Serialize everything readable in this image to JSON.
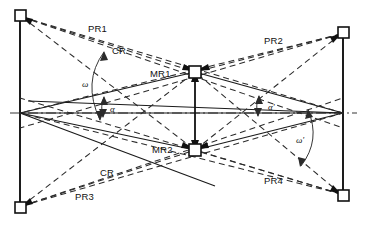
{
  "figure": {
    "background_color": "#ffffff",
    "line_color": "#111111",
    "dash_color": "#2b2b2b"
  },
  "labels": {
    "pr1": "PR1",
    "pr2": "PR2",
    "pr3": "PR3",
    "pr4": "PR4",
    "cr_top": "CR",
    "cr_bottom": "CR",
    "mr1": "MR1",
    "mr2": "MR2",
    "omega": "ω",
    "alpha": "α",
    "alpha_prime": "α'",
    "omega_prime": "ω'"
  },
  "nodes": [
    {
      "name": "corner-top-left",
      "x": 20,
      "y": 15,
      "shape": "square"
    },
    {
      "name": "corner-bottom-left",
      "x": 20,
      "y": 208,
      "shape": "square"
    },
    {
      "name": "corner-top-right",
      "x": 343,
      "y": 32,
      "shape": "square"
    },
    {
      "name": "corner-bottom-right",
      "x": 343,
      "y": 196,
      "shape": "square"
    },
    {
      "name": "mid-reflector-1",
      "x": 195,
      "y": 72,
      "shape": "square"
    },
    {
      "name": "mid-reflector-2",
      "x": 195,
      "y": 150,
      "shape": "square"
    },
    {
      "name": "vertex-left",
      "x": 20,
      "y": 113,
      "shape": "point"
    },
    {
      "name": "vertex-right",
      "x": 343,
      "y": 113,
      "shape": "point"
    }
  ],
  "label_positions": {
    "pr1": {
      "x": 88,
      "y": 32
    },
    "cr_top": {
      "x": 112,
      "y": 54
    },
    "mr1": {
      "x": 150,
      "y": 77
    },
    "pr2": {
      "x": 264,
      "y": 44
    },
    "omega": {
      "x": 82,
      "y": 87
    },
    "alpha": {
      "x": 110,
      "y": 112
    },
    "alpha_prime": {
      "x": 268,
      "y": 110
    },
    "omega_prime": {
      "x": 296,
      "y": 143
    },
    "mr2": {
      "x": 152,
      "y": 153
    },
    "cr_bottom": {
      "x": 100,
      "y": 176
    },
    "pr3": {
      "x": 75,
      "y": 200
    },
    "pr4": {
      "x": 264,
      "y": 184
    }
  },
  "axis": {
    "centerline_y": 113,
    "centerline_style": "dash-dot",
    "x_start": 10,
    "x_end": 355
  }
}
